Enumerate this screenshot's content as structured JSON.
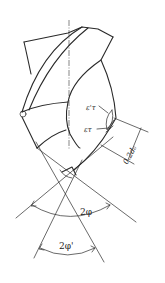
{
  "figure": {
    "labels": {
      "eps_prime_tau": "ε'τ",
      "eps_tau": "ετ",
      "dimension": "0.2d₀",
      "point_angle": "2φ",
      "secondary_point_angle": "2φ'"
    },
    "colors": {
      "line": "#2a2a2a",
      "background": "#ffffff"
    }
  }
}
